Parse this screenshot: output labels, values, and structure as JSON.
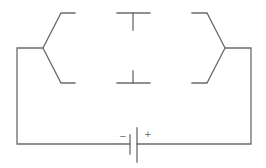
{
  "diagram": {
    "type": "circuit",
    "stroke_color": "#6b6b6b",
    "background": "#ffffff",
    "components": [
      {
        "id": "left-electrode",
        "type": "forked-electrode",
        "junction": [
          43,
          48
        ]
      },
      {
        "id": "center-gap",
        "type": "parallel-plate-terminals",
        "top": [
          133,
          13
        ],
        "bottom": [
          133,
          83
        ]
      },
      {
        "id": "right-electrode",
        "type": "forked-electrode",
        "junction": [
          225,
          48
        ]
      },
      {
        "id": "battery",
        "type": "cell",
        "negative_label": "−",
        "positive_label": "+"
      }
    ]
  },
  "battery": {
    "negative_label": "−",
    "positive_label": "+"
  }
}
